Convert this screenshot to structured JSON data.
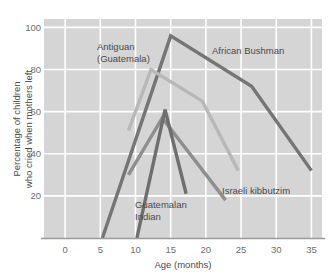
{
  "chart_data": {
    "type": "line",
    "title": "",
    "subtitle": "",
    "xlabel": "Age (months)",
    "ylabel_line1": "Percentage of children",
    "ylabel_line2": "who cried when mothers left",
    "xlim": [
      -3,
      36.5
    ],
    "ylim": [
      0,
      104
    ],
    "xticks": [
      0,
      5,
      10,
      15,
      20,
      25,
      30,
      35
    ],
    "xtick_labels": [
      "0",
      "5",
      "10",
      "15",
      "20",
      "25",
      "30",
      "35"
    ],
    "yticks": [
      20,
      40,
      60,
      80,
      100
    ],
    "ytick_labels": [
      "20",
      "40",
      "60",
      "80",
      "100"
    ],
    "grid": true,
    "grid_color": "#ffffff",
    "plot_background": "#d5d5d5",
    "legend_position": "inline-annotations",
    "series": [
      {
        "name": "African Bushman",
        "color": "#757575",
        "width": 3.4,
        "x": [
          5.3,
          15.0,
          26.5,
          35.0
        ],
        "values": [
          0,
          96,
          72,
          32
        ]
      },
      {
        "name": "Antiguan (Guatemala)",
        "color": "#b8b8b8",
        "width": 3.4,
        "x": [
          9.0,
          12.2,
          19.5,
          24.6
        ],
        "values": [
          51,
          80,
          65,
          32
        ]
      },
      {
        "name": "Israeli kibbutzim",
        "color": "#8e8e8e",
        "width": 3.4,
        "x": [
          9.0,
          13.8,
          22.8
        ],
        "values": [
          30,
          57,
          18
        ]
      },
      {
        "name": "Guatemalan Indian",
        "color": "#6e6e6e",
        "width": 3.4,
        "x": [
          10.2,
          14.2,
          17.2
        ],
        "values": [
          0,
          61,
          21
        ]
      }
    ],
    "annotations": [
      {
        "name": "African Bushman",
        "text": "African Bushman",
        "x_px": 212,
        "y_px": 54
      },
      {
        "name": "Antiguan (Guatemala)",
        "text_line1": "Antiguan",
        "text_line2": "(Guatemala)",
        "x_px": 97,
        "y_px": 50
      },
      {
        "name": "Israeli kibbutzim",
        "text": "Israeli kibbutzim",
        "x_px": 222,
        "y_px": 194
      },
      {
        "name": "Guatemalan Indian",
        "text_line1": "Guatemalan",
        "text_line2": "Indian",
        "x_px": 135,
        "y_px": 208
      }
    ]
  }
}
